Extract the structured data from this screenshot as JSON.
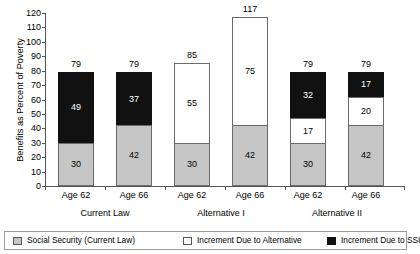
{
  "chart_data": {
    "type": "bar",
    "title": "",
    "xlabel": "",
    "ylabel": "Benefits as Percent of Poverty",
    "ylim": [
      0,
      120
    ],
    "ytick_step": 10,
    "yticks": [
      "120",
      "110",
      "100",
      "90",
      "80",
      "70",
      "60",
      "50",
      "40",
      "30",
      "20",
      "10",
      "0"
    ],
    "grid": false,
    "stacked": true,
    "legend_position": "bottom",
    "categories": [
      "Age 62",
      "Age 66",
      "Age 62",
      "Age 66",
      "Age 62",
      "Age 66"
    ],
    "groups": [
      {
        "label": "Current Law",
        "categories": [
          "Age 62",
          "Age 66"
        ]
      },
      {
        "label": "Alternative I",
        "categories": [
          "Age 62",
          "Age 66"
        ]
      },
      {
        "label": "Alternative II",
        "categories": [
          "Age 62",
          "Age 66"
        ]
      }
    ],
    "series": [
      {
        "name": "Social Security (Current Law)",
        "color": "#c6c6c6",
        "values": [
          30,
          42,
          30,
          42,
          30,
          42
        ]
      },
      {
        "name": "Increment Due to Alternative",
        "color": "#ffffff",
        "values": [
          0,
          0,
          55,
          75,
          17,
          20
        ]
      },
      {
        "name": "Increment Due to SSI",
        "color": "#111111",
        "values": [
          49,
          37,
          0,
          0,
          32,
          17
        ]
      }
    ],
    "totals": [
      79,
      79,
      85,
      117,
      79,
      79
    ],
    "bars": [
      {
        "group": "Current Law",
        "category": "Age 62",
        "total": "79",
        "segments": [
          {
            "series": "Social Security (Current Law)",
            "value": "30"
          },
          {
            "series": "Increment Due to SSI",
            "value": "49"
          }
        ]
      },
      {
        "group": "Current Law",
        "category": "Age 66",
        "total": "79",
        "segments": [
          {
            "series": "Social Security (Current Law)",
            "value": "42"
          },
          {
            "series": "Increment Due to SSI",
            "value": "37"
          }
        ]
      },
      {
        "group": "Alternative I",
        "category": "Age 62",
        "total": "85",
        "segments": [
          {
            "series": "Social Security (Current Law)",
            "value": "30"
          },
          {
            "series": "Increment Due to Alternative",
            "value": "55"
          }
        ]
      },
      {
        "group": "Alternative I",
        "category": "Age 66",
        "total": "117",
        "segments": [
          {
            "series": "Social Security (Current Law)",
            "value": "42"
          },
          {
            "series": "Increment Due to Alternative",
            "value": "75"
          }
        ]
      },
      {
        "group": "Alternative II",
        "category": "Age 62",
        "total": "79",
        "segments": [
          {
            "series": "Social Security (Current Law)",
            "value": "30"
          },
          {
            "series": "Increment Due to Alternative",
            "value": "17"
          },
          {
            "series": "Increment Due to SSI",
            "value": "32"
          }
        ]
      },
      {
        "group": "Alternative II",
        "category": "Age 66",
        "total": "79",
        "segments": [
          {
            "series": "Social Security (Current Law)",
            "value": "42"
          },
          {
            "series": "Increment Due to Alternative",
            "value": "20"
          },
          {
            "series": "Increment Due to SSI",
            "value": "17"
          }
        ]
      }
    ]
  },
  "axis": {
    "y_title": "Benefits as Percent of Poverty",
    "y_labels": [
      "120",
      "110",
      "100",
      "90",
      "80",
      "70",
      "60",
      "50",
      "40",
      "30",
      "20",
      "10",
      "0"
    ]
  },
  "x_labels": [
    "Age 62",
    "Age 66",
    "Age 62",
    "Age 66",
    "Age 62",
    "Age 66"
  ],
  "group_labels": [
    "Current Law",
    "Alternative I",
    "Alternative II"
  ],
  "legend": {
    "items": [
      {
        "label": "Social Security (Current Law)",
        "swatch": "ss",
        "color": "#c6c6c6"
      },
      {
        "label": "Increment Due to Alternative",
        "swatch": "alt",
        "color": "#ffffff"
      },
      {
        "label": "Increment Due to SSI",
        "swatch": "ssi",
        "color": "#111111"
      }
    ]
  },
  "bar_values": {
    "b0": {
      "total": "79",
      "s0": "30",
      "s2": "49"
    },
    "b1": {
      "total": "79",
      "s0": "42",
      "s2": "37"
    },
    "b2": {
      "total": "85",
      "s0": "30",
      "s1": "55"
    },
    "b3": {
      "total": "117",
      "s0": "42",
      "s1": "75"
    },
    "b4": {
      "total": "79",
      "s0": "30",
      "s1": "17",
      "s2": "32"
    },
    "b5": {
      "total": "79",
      "s0": "42",
      "s1": "20",
      "s2": "17"
    }
  }
}
